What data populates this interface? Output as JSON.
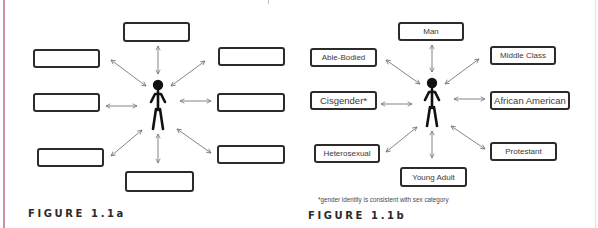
{
  "figure_a": {
    "caption": "FIGURE 1.1a",
    "boxes": [
      {
        "position": "top",
        "label": ""
      },
      {
        "position": "upper-left",
        "label": ""
      },
      {
        "position": "upper-right",
        "label": ""
      },
      {
        "position": "middle-left",
        "label": ""
      },
      {
        "position": "middle-right",
        "label": ""
      },
      {
        "position": "lower-left",
        "label": ""
      },
      {
        "position": "lower-right",
        "label": ""
      },
      {
        "position": "bottom",
        "label": ""
      }
    ],
    "center": "person-icon"
  },
  "figure_b": {
    "caption": "FIGURE 1.1b",
    "boxes": [
      {
        "position": "top",
        "label": "Man"
      },
      {
        "position": "upper-left",
        "label": "Able-Bodied"
      },
      {
        "position": "upper-right",
        "label": "Middle Class"
      },
      {
        "position": "middle-left",
        "label": "Cisgender*"
      },
      {
        "position": "middle-right",
        "label": "African American"
      },
      {
        "position": "lower-left",
        "label": "Heterosexual"
      },
      {
        "position": "lower-right",
        "label": "Protestant"
      },
      {
        "position": "bottom",
        "label": "Young Adult"
      }
    ],
    "center": "person-icon",
    "footnote": "*gender identity is consistent with sex category"
  },
  "colors": {
    "stroke": "#2b2b2b",
    "arrow": "#6e6e6e",
    "margin_rule": "#cf8fab"
  }
}
